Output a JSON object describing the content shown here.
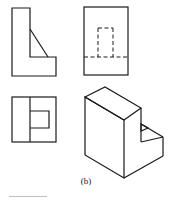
{
  "figure": {
    "caption": "(b)",
    "views": [
      {
        "name": "front-view",
        "type": "orthographic"
      },
      {
        "name": "side-view",
        "type": "orthographic",
        "hidden_lines": true
      },
      {
        "name": "top-view",
        "type": "orthographic"
      },
      {
        "name": "isometric-view",
        "type": "isometric"
      }
    ],
    "line_color": "#1a1a1a",
    "rule_color": "#bfbfbf"
  }
}
